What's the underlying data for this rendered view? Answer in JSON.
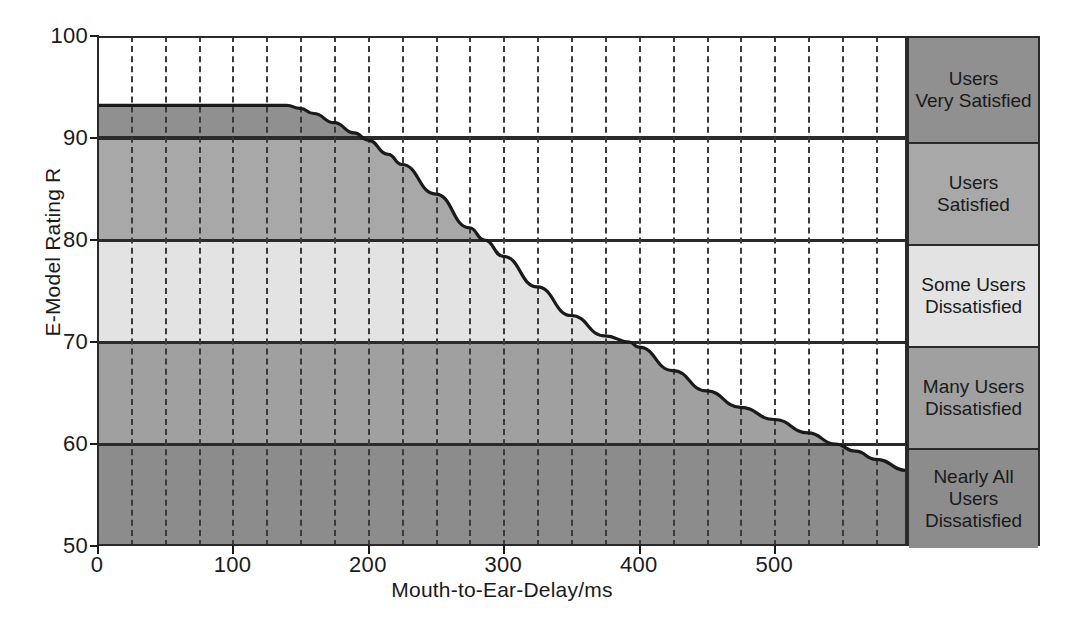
{
  "chart_data": {
    "type": "area",
    "title": "",
    "xlabel": "Mouth-to-Ear-Delay/ms",
    "ylabel": "E-Model Rating R",
    "xlim": [
      0,
      598
    ],
    "ylim": [
      50,
      100
    ],
    "xticks": [
      0,
      100,
      200,
      300,
      400,
      500
    ],
    "yticks": [
      50,
      60,
      70,
      80,
      90,
      100
    ],
    "xtick_labels": [
      "0",
      "100",
      "200",
      "300",
      "400",
      "500"
    ],
    "ytick_labels": [
      "50",
      "60",
      "70",
      "80",
      "90",
      "100"
    ],
    "minor_gridline_step": 25,
    "grid": "vertical-dashed-minor, horizontal-solid-at-band-thresholds",
    "legend_position": "right-panel",
    "series": [
      {
        "name": "E-Model Rating R vs Mouth-to-Ear Delay",
        "x": [
          0,
          25,
          50,
          75,
          100,
          125,
          140,
          150,
          160,
          175,
          190,
          200,
          215,
          225,
          250,
          275,
          286,
          300,
          325,
          350,
          375,
          393,
          400,
          425,
          450,
          475,
          500,
          525,
          545,
          560,
          575,
          598
        ],
        "y": [
          93.2,
          93.2,
          93.2,
          93.2,
          93.2,
          93.2,
          93.2,
          92.9,
          92.4,
          91.5,
          90.5,
          89.8,
          88.4,
          87.4,
          84.5,
          81.2,
          80.0,
          78.4,
          75.4,
          72.6,
          70.6,
          70.0,
          69.5,
          67.2,
          65.2,
          63.6,
          62.4,
          61.1,
          60.0,
          59.3,
          58.5,
          57.4
        ]
      }
    ],
    "bands": [
      {
        "label": "Users Very Satisfied",
        "from": 90,
        "to": 100,
        "color": "#909090"
      },
      {
        "label": "Users Satisfied",
        "from": 80,
        "to": 90,
        "color": "#a8a8a8"
      },
      {
        "label": "Some Users Dissatisfied",
        "from": 70,
        "to": 80,
        "color": "#e3e3e3"
      },
      {
        "label": "Many Users Dissatisfied",
        "from": 60,
        "to": 70,
        "color": "#a0a0a0"
      },
      {
        "label": "Nearly All Users Dissatisfied",
        "from": 50,
        "to": 60,
        "color": "#8c8c8c"
      }
    ],
    "curve_plateau_value": 93.2,
    "threshold_crossings": [
      {
        "rating": 90,
        "delay_ms": 198
      },
      {
        "rating": 80,
        "delay_ms": 286
      },
      {
        "rating": 70,
        "delay_ms": 393
      },
      {
        "rating": 60,
        "delay_ms": 545
      }
    ]
  },
  "legend_rows": [
    {
      "line1": "Users",
      "line2": "Very Satisfied",
      "line3": ""
    },
    {
      "line1": "Users",
      "line2": "Satisfied",
      "line3": ""
    },
    {
      "line1": "Some Users",
      "line2": "Dissatisfied",
      "line3": ""
    },
    {
      "line1": "Many Users",
      "line2": "Dissatisfied",
      "line3": ""
    },
    {
      "line1": "Nearly All",
      "line2": "Users",
      "line3": "Dissatisfied"
    }
  ],
  "colors": {
    "band_very_satisfied": "#909090",
    "band_satisfied": "#a8a8a8",
    "band_some_dissatisfied": "#e3e3e3",
    "band_many_dissatisfied": "#a0a0a0",
    "band_nearly_all_dissatisfied": "#8c8c8c",
    "axis": "#2a2a2a",
    "curve": "#1a1a1a",
    "background": "#ffffff"
  }
}
